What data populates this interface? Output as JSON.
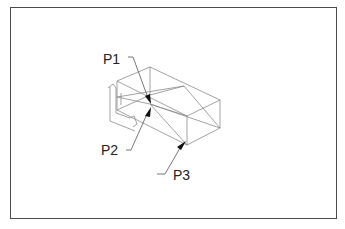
{
  "figure": {
    "type": "isometric wireframe drawing",
    "labels": [
      {
        "id": "P1",
        "text": "P1"
      },
      {
        "id": "P2",
        "text": "P2"
      },
      {
        "id": "P3",
        "text": "P3"
      }
    ],
    "colors": {
      "frame": "#4a4a4a",
      "edges": "#8a8a8a",
      "arrows": "#111111",
      "text": "#222222"
    }
  }
}
